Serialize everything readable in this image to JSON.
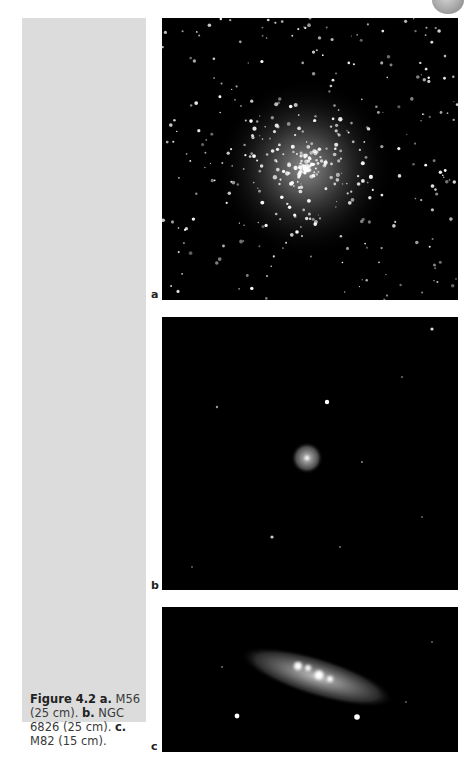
{
  "figure": {
    "number_label": "Figure 4.2",
    "caption_parts": [
      {
        "bold": "a.",
        "text": " M56 (25 cm)."
      },
      {
        "bold": "b.",
        "text": " NGC 6826 (25 cm)."
      },
      {
        "bold": "c.",
        "text": " M82 (15 cm)."
      }
    ],
    "caption_text": "M56 (25 cm). b. NGC 6826 (25 cm). c. M82 (15 cm).",
    "caption_a_bold": "a.",
    "caption_a_text": " M56 (25 cm). ",
    "caption_b_bold": "b.",
    "caption_b_text": " NGC 6826 (25 cm). ",
    "caption_c_bold": "c.",
    "caption_c_text": " M82 (15 cm).",
    "panels": [
      {
        "label": "a",
        "object": "M56",
        "aperture": "25 cm",
        "type": "globular cluster"
      },
      {
        "label": "b",
        "object": "NGC 6826",
        "aperture": "25 cm",
        "type": "planetary nebula"
      },
      {
        "label": "c",
        "object": "M82",
        "aperture": "15 cm",
        "type": "galaxy"
      }
    ]
  }
}
